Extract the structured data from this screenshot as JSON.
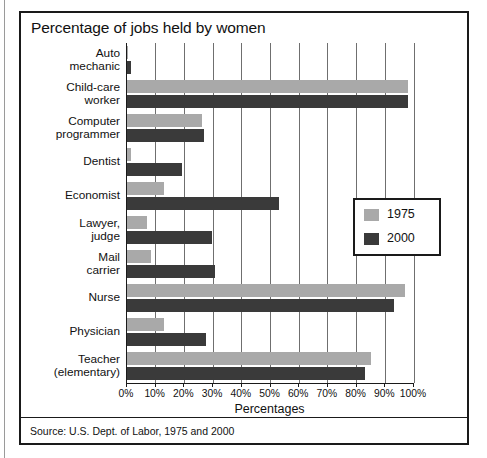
{
  "figure": {
    "title": "Percentage of jobs held by women",
    "source_note": "Source: U.S. Dept. of Labor, 1975 and 2000"
  },
  "legend": {
    "entries": [
      {
        "label": "1975",
        "color": "#a9a9a9"
      },
      {
        "label": "2000",
        "color": "#3a3a3a"
      }
    ]
  },
  "axis": {
    "x_title": "Percentages",
    "x_ticks": [
      "0%",
      "10%",
      "20%",
      "30%",
      "40%",
      "50%",
      "60%",
      "70%",
      "80%",
      "90%",
      "100%"
    ]
  },
  "chart_data": {
    "type": "bar",
    "orientation": "horizontal",
    "title": "Percentage of jobs held by women",
    "xlabel": "Percentages",
    "ylabel": "",
    "xlim": [
      0,
      100
    ],
    "xtick_values": [
      0,
      10,
      20,
      30,
      40,
      50,
      60,
      70,
      80,
      90,
      100
    ],
    "xtick_labels": [
      "0%",
      "10%",
      "20%",
      "30%",
      "40%",
      "50%",
      "60%",
      "70%",
      "80%",
      "90%",
      "100%"
    ],
    "grid": "vertical",
    "legend_position": "inside-right",
    "categories": [
      "Auto mechanic",
      "Child-care worker",
      "Computer programmer",
      "Dentist",
      "Economist",
      "Lawyer, judge",
      "Mail carrier",
      "Nurse",
      "Physician",
      "Teacher (elementary)"
    ],
    "series": [
      {
        "name": "1975",
        "color": "#a9a9a9",
        "values": [
          0.5,
          98,
          26,
          1.5,
          13,
          7,
          8.5,
          97,
          13,
          85
        ]
      },
      {
        "name": "2000",
        "color": "#3a3a3a",
        "values": [
          1.5,
          98,
          27,
          19,
          53,
          29.5,
          30.5,
          93,
          27.5,
          83
        ]
      }
    ],
    "source": "U.S. Dept. of Labor, 1975 and 2000"
  },
  "category_labels": [
    "Auto\nmechanic",
    "Child-care\nworker",
    "Computer\nprogrammer",
    "Dentist",
    "Economist",
    "Lawyer,\njudge",
    "Mail\ncarrier",
    "Nurse",
    "Physician",
    "Teacher\n(elementary)"
  ]
}
